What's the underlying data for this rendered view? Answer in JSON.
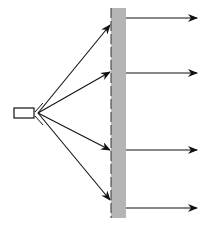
{
  "diagram": {
    "type": "beam-through-wall",
    "colors": {
      "stroke": "#111111",
      "wall_fill": "#b5b5b5",
      "background": "#ffffff"
    },
    "source": {
      "label": ""
    },
    "wall": {
      "x": 111,
      "y": 8,
      "width": 15,
      "height": 210
    },
    "incident_rays": [
      {
        "x1": 38,
        "y1": 113,
        "x2": 110,
        "y2": 25
      },
      {
        "x1": 38,
        "y1": 113,
        "x2": 110,
        "y2": 72
      },
      {
        "x1": 38,
        "y1": 113,
        "x2": 110,
        "y2": 150
      },
      {
        "x1": 38,
        "y1": 113,
        "x2": 110,
        "y2": 200
      }
    ],
    "output_rays": [
      {
        "x1": 126,
        "y1": 18,
        "x2": 197,
        "y2": 18
      },
      {
        "x1": 126,
        "y1": 73,
        "x2": 197,
        "y2": 73
      },
      {
        "x1": 126,
        "y1": 150,
        "x2": 197,
        "y2": 150
      },
      {
        "x1": 126,
        "y1": 208,
        "x2": 197,
        "y2": 208
      }
    ]
  }
}
